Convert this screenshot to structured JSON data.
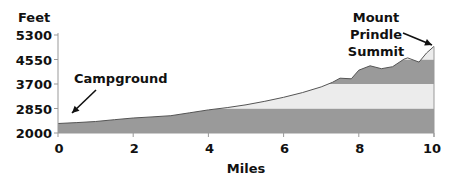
{
  "chart_data": {
    "type": "area",
    "title": "",
    "xlabel": "Miles",
    "ylabel": "Feet",
    "xlim": [
      0,
      10
    ],
    "ylim": [
      2000,
      5300
    ],
    "x_ticks": [
      0,
      2,
      4,
      6,
      8,
      10
    ],
    "y_ticks": [
      2000,
      2850,
      3700,
      4550,
      5300
    ],
    "grid": false,
    "legend": null,
    "series": [
      {
        "name": "Elevation profile",
        "x": [
          0,
          0.5,
          1,
          1.5,
          2,
          2.5,
          3,
          3.5,
          4,
          4.5,
          5,
          5.5,
          6,
          6.5,
          7,
          7.3,
          7.5,
          7.8,
          8,
          8.3,
          8.6,
          8.9,
          9.2,
          9.3,
          9.6,
          9.8,
          10
        ],
        "values": [
          2330,
          2360,
          2400,
          2460,
          2520,
          2560,
          2600,
          2700,
          2800,
          2880,
          2980,
          3100,
          3240,
          3400,
          3600,
          3760,
          3900,
          3880,
          4180,
          4330,
          4230,
          4300,
          4560,
          4600,
          4460,
          4750,
          4950
        ]
      }
    ],
    "bands": [
      {
        "from": 2000,
        "to": 2850,
        "shade": "dark"
      },
      {
        "from": 2850,
        "to": 3700,
        "shade": "light"
      },
      {
        "from": 3700,
        "to": 4550,
        "shade": "dark"
      },
      {
        "from": 4550,
        "to": 5300,
        "shade": "light"
      }
    ],
    "annotations": [
      {
        "text": "Campground",
        "x": 0,
        "y": 2330,
        "arrow": true
      },
      {
        "text": [
          "Mount",
          "Prindle",
          "Summit"
        ],
        "x": 10,
        "y": 4950,
        "arrow": true
      }
    ]
  },
  "colors": {
    "dark_band": "#9a9a9a",
    "light_band": "#ececec",
    "outline": "#555555",
    "axis": "#999999",
    "text": "#111111"
  },
  "labels": {
    "y_axis_title": "Feet",
    "x_axis_title": "Miles",
    "campground": "Campground",
    "summit_line1": "Mount",
    "summit_line2": "Prindle",
    "summit_line3": "Summit"
  }
}
